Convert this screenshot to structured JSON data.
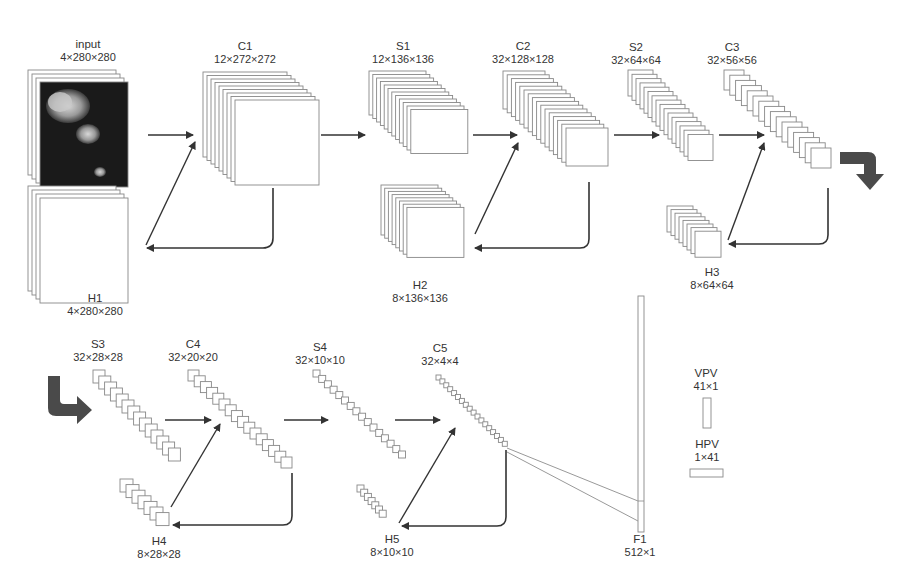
{
  "diagram": {
    "title": "",
    "layers": [
      {
        "id": "input",
        "name": "input",
        "dims": "4×280×280",
        "label_x": 88,
        "label_y": 38
      },
      {
        "id": "H1",
        "name": "H1",
        "dims": "4×280×280",
        "label_x": 95,
        "label_y": 292
      },
      {
        "id": "C1",
        "name": "C1",
        "dims": "12×272×272",
        "label_x": 245,
        "label_y": 40
      },
      {
        "id": "S1",
        "name": "S1",
        "dims": "12×136×136",
        "label_x": 403,
        "label_y": 40
      },
      {
        "id": "H2",
        "name": "H2",
        "dims": "8×136×136",
        "label_x": 420,
        "label_y": 279
      },
      {
        "id": "C2",
        "name": "C2",
        "dims": "32×128×128",
        "label_x": 523,
        "label_y": 40
      },
      {
        "id": "S2",
        "name": "S2",
        "dims": "32×64×64",
        "label_x": 636,
        "label_y": 41
      },
      {
        "id": "C3",
        "name": "C3",
        "dims": "32×56×56",
        "label_x": 732,
        "label_y": 41
      },
      {
        "id": "H3",
        "name": "H3",
        "dims": "8×64×64",
        "label_x": 712,
        "label_y": 266
      },
      {
        "id": "S3",
        "name": "S3",
        "dims": "32×28×28",
        "label_x": 98,
        "label_y": 338
      },
      {
        "id": "C4",
        "name": "C4",
        "dims": "32×20×20",
        "label_x": 193,
        "label_y": 338
      },
      {
        "id": "H4",
        "name": "H4",
        "dims": "8×28×28",
        "label_x": 159,
        "label_y": 535
      },
      {
        "id": "S4",
        "name": "S4",
        "dims": "32×10×10",
        "label_x": 320,
        "label_y": 341
      },
      {
        "id": "C5",
        "name": "C5",
        "dims": "32×4×4",
        "label_x": 440,
        "label_y": 342
      },
      {
        "id": "H5",
        "name": "H5",
        "dims": "8×10×10",
        "label_x": 392,
        "label_y": 533
      },
      {
        "id": "F1",
        "name": "F1",
        "dims": "512×1",
        "label_x": 640,
        "label_y": 533
      },
      {
        "id": "VPV",
        "name": "VPV",
        "dims": "41×1",
        "label_x": 706,
        "label_y": 367
      },
      {
        "id": "HPV",
        "name": "HPV",
        "dims": "1×41",
        "label_x": 707,
        "label_y": 438
      }
    ],
    "stacks": [
      {
        "id": "input",
        "count": 4,
        "x": 28,
        "y": 70,
        "w": 88,
        "h": 105,
        "dx": 4,
        "dy": 4,
        "last_fill": "#1a1a1a",
        "is_image": true
      },
      {
        "id": "H1",
        "count": 4,
        "x": 28,
        "y": 186,
        "w": 88,
        "h": 105,
        "dx": 4,
        "dy": 4
      },
      {
        "id": "C1",
        "count": 9,
        "x": 203,
        "y": 72,
        "w": 84,
        "h": 85,
        "dx": 4,
        "dy": 3.5
      },
      {
        "id": "S1",
        "count": 12,
        "x": 369,
        "y": 71,
        "w": 57,
        "h": 44,
        "dx": 3.8,
        "dy": 3.5
      },
      {
        "id": "H2",
        "count": 8,
        "x": 381,
        "y": 185,
        "w": 57,
        "h": 50,
        "dx": 3.7,
        "dy": 3.2
      },
      {
        "id": "C2",
        "count": 16,
        "x": 503,
        "y": 71,
        "w": 42,
        "h": 38,
        "dx": 4.2,
        "dy": 3.8
      },
      {
        "id": "S2",
        "count": 16,
        "x": 628,
        "y": 70,
        "w": 25,
        "h": 26,
        "dx": 4.0,
        "dy": 4.3
      },
      {
        "id": "C3",
        "count": 16,
        "x": 724,
        "y": 70,
        "w": 20,
        "h": 20,
        "dx": 5.8,
        "dy": 5.2
      },
      {
        "id": "H3",
        "count": 8,
        "x": 667,
        "y": 206,
        "w": 26,
        "h": 26,
        "dx": 4.0,
        "dy": 3.6
      },
      {
        "id": "S3",
        "count": 14,
        "x": 93,
        "y": 370,
        "w": 12,
        "h": 13,
        "dx": 5.8,
        "dy": 6.0
      },
      {
        "id": "C4",
        "count": 16,
        "x": 188,
        "y": 370,
        "w": 11,
        "h": 11,
        "dx": 6.2,
        "dy": 5.8
      },
      {
        "id": "H4",
        "count": 7,
        "x": 120,
        "y": 479,
        "w": 13,
        "h": 13,
        "dx": 6.0,
        "dy": 5.6
      },
      {
        "id": "S4",
        "count": 16,
        "x": 313,
        "y": 370,
        "w": 7,
        "h": 7,
        "dx": 5.7,
        "dy": 5.4
      },
      {
        "id": "C5",
        "count": 18,
        "x": 436,
        "y": 375,
        "w": 5,
        "h": 5,
        "dx": 3.9,
        "dy": 3.9
      },
      {
        "id": "H5",
        "count": 7,
        "x": 357,
        "y": 485,
        "w": 7,
        "h": 7,
        "dx": 3.7,
        "dy": 4.2
      }
    ],
    "vectors": [
      {
        "id": "F1",
        "x": 638,
        "y": 296,
        "w": 6,
        "h": 236
      },
      {
        "id": "VPV",
        "x": 703,
        "y": 398,
        "w": 8,
        "h": 30
      },
      {
        "id": "HPV",
        "x": 690,
        "y": 469,
        "w": 33,
        "h": 8
      }
    ],
    "arrows": [
      {
        "from": "input",
        "to": "C1",
        "type": "straight",
        "path": "M148,135 L193,135"
      },
      {
        "from": "H1",
        "to": "C1",
        "type": "straight",
        "path": "M146,245 L195,142"
      },
      {
        "from": "C1",
        "to": "H1",
        "type": "elbow",
        "path": "M273,188 L273,238 Q273,248 263,248 L147,248"
      },
      {
        "from": "C1",
        "to": "S1",
        "type": "straight",
        "path": "M321,135 L365,135"
      },
      {
        "from": "S1",
        "to": "C2",
        "type": "straight",
        "path": "M473,135 L517,135"
      },
      {
        "from": "H2",
        "to": "C2",
        "type": "straight",
        "path": "M475,234 L518,143"
      },
      {
        "from": "C2",
        "to": "H2",
        "type": "elbow",
        "path": "M589,182 L589,239 Q589,248 580,248 L475,248"
      },
      {
        "from": "C2",
        "to": "S2",
        "type": "straight",
        "path": "M614,135 L659,135"
      },
      {
        "from": "S2",
        "to": "C3",
        "type": "straight",
        "path": "M719,135 L764,135"
      },
      {
        "from": "H3",
        "to": "C3",
        "type": "straight",
        "path": "M728,240 L764,143"
      },
      {
        "from": "C3",
        "to": "H3",
        "type": "elbow",
        "path": "M828,188 L828,235 Q828,244 819,244 L729,244"
      },
      {
        "from": "S3",
        "to": "C4",
        "type": "straight",
        "path": "M165,420 L211,420"
      },
      {
        "from": "H4",
        "to": "C4",
        "type": "straight",
        "path": "M171,507 L220,424"
      },
      {
        "from": "C4",
        "to": "H4",
        "type": "elbow",
        "path": "M292,473 L292,516 Q292,525 283,525 L173,525"
      },
      {
        "from": "C4",
        "to": "S4",
        "type": "straight",
        "path": "M284,420 L328,420"
      },
      {
        "from": "S4",
        "to": "C5",
        "type": "straight",
        "path": "M395,420 L440,420"
      },
      {
        "from": "H5",
        "to": "C5",
        "type": "straight",
        "path": "M399,523 L455,428"
      },
      {
        "from": "C5",
        "to": "H5",
        "type": "elbow",
        "path": "M506,450 L506,517 Q506,526 497,526 L402,526"
      }
    ],
    "flow_arrows": [
      {
        "id": "wrap-down",
        "direction": "right-then-down",
        "color": "#4a4a4a"
      },
      {
        "id": "wrap-right",
        "direction": "down-then-right",
        "color": "#4a4a4a"
      }
    ],
    "colors": {
      "line": "#888888",
      "arrow": "#333333",
      "flow_arrow": "#4a4a4a",
      "text": "#333333",
      "feature_map_fill": "#ffffff"
    }
  }
}
